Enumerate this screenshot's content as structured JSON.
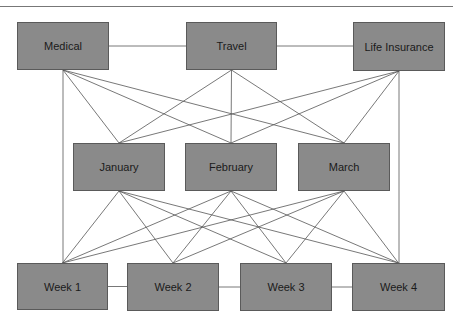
{
  "diagram": {
    "type": "network",
    "top_rule": true,
    "colors": {
      "node_fill": "#8a8a8a",
      "node_border": "#5a5a5a",
      "edge": "#555555",
      "text": "#1a1a1a"
    },
    "nodes": [
      {
        "id": "medical",
        "label": "Medical",
        "x": 17,
        "y": 22,
        "w": 92,
        "h": 48
      },
      {
        "id": "travel",
        "label": "Travel",
        "x": 186,
        "y": 22,
        "w": 91,
        "h": 48
      },
      {
        "id": "life",
        "label": "Life Insurance",
        "x": 353,
        "y": 22,
        "w": 92,
        "h": 49
      },
      {
        "id": "jan",
        "label": "January",
        "x": 73,
        "y": 143,
        "w": 92,
        "h": 48
      },
      {
        "id": "feb",
        "label": "February",
        "x": 185,
        "y": 143,
        "w": 92,
        "h": 48
      },
      {
        "id": "mar",
        "label": "March",
        "x": 298,
        "y": 143,
        "w": 92,
        "h": 48
      },
      {
        "id": "w1",
        "label": "Week 1",
        "x": 17,
        "y": 263,
        "w": 91,
        "h": 47
      },
      {
        "id": "w2",
        "label": "Week 2",
        "x": 127,
        "y": 263,
        "w": 92,
        "h": 48
      },
      {
        "id": "w3",
        "label": "Week 3",
        "x": 240,
        "y": 263,
        "w": 92,
        "h": 48
      },
      {
        "id": "w4",
        "label": "Week 4",
        "x": 352,
        "y": 263,
        "w": 93,
        "h": 48
      }
    ],
    "edges": [
      {
        "from": "medical",
        "to": "travel",
        "kind": "horizontal"
      },
      {
        "from": "travel",
        "to": "life",
        "kind": "horizontal"
      },
      {
        "from": "w1",
        "to": "w2",
        "kind": "horizontal"
      },
      {
        "from": "w2",
        "to": "w3",
        "kind": "horizontal"
      },
      {
        "from": "w3",
        "to": "w4",
        "kind": "horizontal"
      },
      {
        "from": "medical",
        "to": "w1",
        "kind": "vertical"
      },
      {
        "from": "life",
        "to": "w4",
        "kind": "vertical"
      },
      {
        "from": "medical",
        "to": "jan"
      },
      {
        "from": "medical",
        "to": "feb"
      },
      {
        "from": "medical",
        "to": "mar"
      },
      {
        "from": "travel",
        "to": "jan"
      },
      {
        "from": "travel",
        "to": "feb"
      },
      {
        "from": "travel",
        "to": "mar"
      },
      {
        "from": "life",
        "to": "jan"
      },
      {
        "from": "life",
        "to": "feb"
      },
      {
        "from": "life",
        "to": "mar"
      },
      {
        "from": "jan",
        "to": "w1"
      },
      {
        "from": "jan",
        "to": "w2"
      },
      {
        "from": "jan",
        "to": "w3"
      },
      {
        "from": "jan",
        "to": "w4"
      },
      {
        "from": "feb",
        "to": "w1"
      },
      {
        "from": "feb",
        "to": "w2"
      },
      {
        "from": "feb",
        "to": "w3"
      },
      {
        "from": "feb",
        "to": "w4"
      },
      {
        "from": "mar",
        "to": "w1"
      },
      {
        "from": "mar",
        "to": "w2"
      },
      {
        "from": "mar",
        "to": "w3"
      },
      {
        "from": "mar",
        "to": "w4"
      }
    ]
  }
}
